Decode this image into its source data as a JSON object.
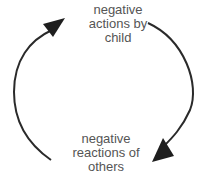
{
  "diagram": {
    "type": "cycle",
    "nodes": [
      {
        "id": "top",
        "lines": [
          "negative",
          "actions by",
          "child"
        ]
      },
      {
        "id": "bottom",
        "lines": [
          "negative",
          "reactions of",
          "others"
        ]
      }
    ],
    "edges": [
      {
        "from": "top",
        "to": "bottom",
        "side": "right"
      },
      {
        "from": "bottom",
        "to": "top",
        "side": "left"
      }
    ],
    "colors": {
      "line": "#2a2a2a",
      "text": "#555555",
      "background": "#ffffff"
    }
  }
}
